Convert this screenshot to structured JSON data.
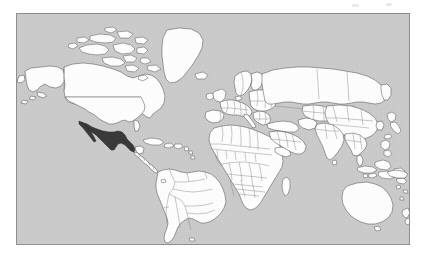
{
  "figure": {
    "kind": "world-map",
    "projection": "equirectangular",
    "canvas_width": 424,
    "canvas_height": 263,
    "background_color": "#ffffff",
    "frame": {
      "x": 16,
      "y": 13,
      "width": 394,
      "height": 232,
      "border_color": "#8e8e8e",
      "border_width": 1
    },
    "ocean_color": "#cccccc",
    "land_color": "#ffffff",
    "border_color": "#4a4a4a",
    "highlight_color": "#3a3a3a",
    "highlighted_region": "Mexico",
    "antarctica_shown": false,
    "graticule_shown": false,
    "labels_shown": false,
    "legend_shown": false,
    "title": ""
  },
  "regions": [
    {
      "name": "Mexico",
      "highlighted": true,
      "fill": "#3a3a3a"
    },
    {
      "name": "United States",
      "highlighted": false,
      "fill": "#ffffff"
    },
    {
      "name": "Canada",
      "highlighted": false,
      "fill": "#ffffff"
    },
    {
      "name": "Greenland",
      "highlighted": false,
      "fill": "#ffffff"
    },
    {
      "name": "South America",
      "highlighted": false,
      "fill": "#ffffff"
    },
    {
      "name": "Europe",
      "highlighted": false,
      "fill": "#ffffff"
    },
    {
      "name": "Africa",
      "highlighted": false,
      "fill": "#ffffff"
    },
    {
      "name": "Asia",
      "highlighted": false,
      "fill": "#ffffff"
    },
    {
      "name": "Australia",
      "highlighted": false,
      "fill": "#ffffff"
    },
    {
      "name": "New Zealand",
      "highlighted": false,
      "fill": "#ffffff"
    }
  ],
  "artifacts": [
    {
      "name": "scan-speck-1",
      "x": 352,
      "y": 4,
      "w": 7,
      "h": 3
    },
    {
      "name": "scan-speck-2",
      "x": 386,
      "y": 3,
      "w": 6,
      "h": 3
    }
  ]
}
